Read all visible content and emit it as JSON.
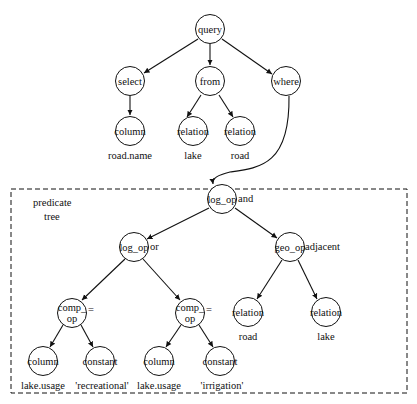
{
  "diagram": {
    "type": "query parse tree",
    "box_label": [
      "predicate",
      "tree"
    ],
    "nodes": [
      {
        "id": "query",
        "label": "query",
        "x": 210,
        "y": 29
      },
      {
        "id": "select",
        "label": "select",
        "x": 130,
        "y": 81
      },
      {
        "id": "from",
        "label": "from",
        "x": 210,
        "y": 81
      },
      {
        "id": "where",
        "label": "where",
        "x": 286,
        "y": 81
      },
      {
        "id": "col1",
        "label": "column",
        "x": 130,
        "y": 131,
        "value": "road.name"
      },
      {
        "id": "rel1",
        "label": "relation",
        "x": 193,
        "y": 131,
        "value": "lake"
      },
      {
        "id": "rel2",
        "label": "relation",
        "x": 240,
        "y": 131,
        "value": "road"
      },
      {
        "id": "and",
        "label": "log_op",
        "x": 222,
        "y": 199,
        "annotation": "and"
      },
      {
        "id": "or",
        "label": "log_op",
        "x": 134,
        "y": 247,
        "annotation": "or"
      },
      {
        "id": "geo",
        "label": "geo_op",
        "x": 290,
        "y": 247,
        "annotation": "adjacent"
      },
      {
        "id": "cmp1",
        "label": "comp_\nop",
        "x": 72,
        "y": 313,
        "annotation": "="
      },
      {
        "id": "cmp2",
        "label": "comp_\nop",
        "x": 190,
        "y": 313,
        "annotation": "="
      },
      {
        "id": "rel3",
        "label": "relation",
        "x": 248,
        "y": 312,
        "value": "road"
      },
      {
        "id": "rel4",
        "label": "relation",
        "x": 326,
        "y": 312,
        "value": "lake"
      },
      {
        "id": "col2",
        "label": "column",
        "x": 43,
        "y": 361,
        "value": "lake.usage"
      },
      {
        "id": "con1",
        "label": "constant",
        "x": 100,
        "y": 361,
        "value": "'recreational'"
      },
      {
        "id": "col3",
        "label": "column",
        "x": 159,
        "y": 361,
        "value": "lake.usage"
      },
      {
        "id": "con2",
        "label": "constant",
        "x": 220,
        "y": 361,
        "value": "'irrigation'"
      }
    ],
    "edges": [
      [
        "query",
        "select"
      ],
      [
        "query",
        "from"
      ],
      [
        "query",
        "where"
      ],
      [
        "select",
        "col1"
      ],
      [
        "from",
        "rel1"
      ],
      [
        "from",
        "rel2"
      ],
      [
        "where",
        "and"
      ],
      [
        "and",
        "or"
      ],
      [
        "and",
        "geo"
      ],
      [
        "or",
        "cmp1"
      ],
      [
        "or",
        "cmp2"
      ],
      [
        "geo",
        "rel3"
      ],
      [
        "geo",
        "rel4"
      ],
      [
        "cmp1",
        "col2"
      ],
      [
        "cmp1",
        "con1"
      ],
      [
        "cmp2",
        "col3"
      ],
      [
        "cmp2",
        "con2"
      ]
    ]
  },
  "labels": {
    "query": "query",
    "select": "select",
    "from": "from",
    "where": "where",
    "column": "column",
    "relation": "relation",
    "log_op": "log_op",
    "geo_op": "geo_op",
    "comp_top": "comp_",
    "comp_bottom": "op",
    "constant": "constant",
    "road_name": "road.name",
    "lake": "lake",
    "road": "road",
    "and": "and",
    "or": "or",
    "adjacent": "adjacent",
    "eq": "=",
    "lake_usage": "lake.usage",
    "recreational": "'recreational'",
    "irrigation": "'irrigation'",
    "predicate": "predicate",
    "tree": "tree"
  }
}
